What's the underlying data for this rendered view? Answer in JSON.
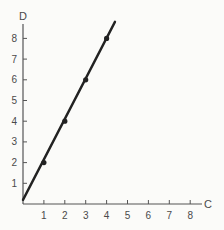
{
  "chart_data": {
    "type": "line",
    "title": "",
    "xlabel": "C",
    "ylabel": "D",
    "xlim": [
      0,
      8.5
    ],
    "ylim": [
      0,
      9
    ],
    "xticks": [
      1,
      2,
      3,
      4,
      5,
      6,
      7,
      8
    ],
    "yticks": [
      1,
      2,
      3,
      4,
      5,
      6,
      7,
      8
    ],
    "grid": false,
    "legend": null,
    "series": [
      {
        "name": "D vs C",
        "markers": true,
        "points": [
          [
            1,
            2
          ],
          [
            2,
            4
          ],
          [
            3,
            6
          ],
          [
            4,
            8
          ]
        ],
        "line_extent": [
          [
            0,
            0.2
          ],
          [
            4.4,
            8.8
          ]
        ]
      }
    ],
    "colors": {
      "axis": "#555555",
      "line": "#222222",
      "background": "#fbfbf9"
    }
  }
}
